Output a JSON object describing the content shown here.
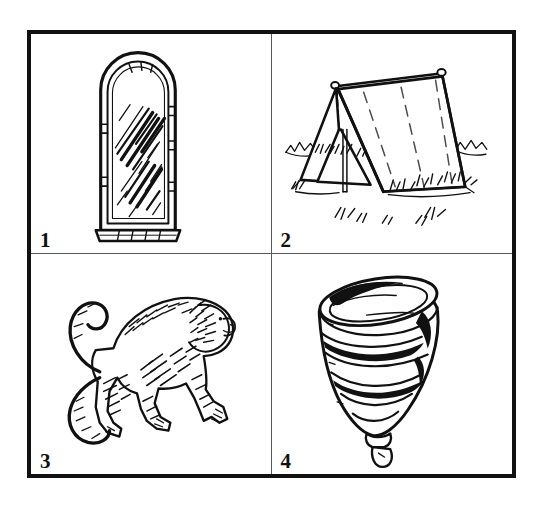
{
  "sheet": {
    "title": "Picture naming card sheet",
    "layout": "2x2 grid of numbered black-and-white line drawings",
    "frame_color": "#111111",
    "divider_color": "#5a5a5a",
    "background_color": "#ffffff",
    "ink_color": "#111111"
  },
  "panels": [
    {
      "number": "1",
      "name": "mirror",
      "label": "mirror",
      "description": "Arched-top standing mirror in a double-outlined frame with diagonal hatch strokes across the glass",
      "position": "top-left"
    },
    {
      "number": "2",
      "name": "tent",
      "label": "tent",
      "description": "A-frame ridge tent with ridge pole, guy lines, open triangular entrance and grass tufts on the ground",
      "position": "top-right"
    },
    {
      "number": "3",
      "name": "monkey",
      "label": "monkey",
      "description": "Monkey walking on all fours facing right with a long curled tail raised behind it",
      "position": "bottom-left"
    },
    {
      "number": "4",
      "name": "spinning-top",
      "label": "spinning top",
      "description": "Spinning top tilted on its point with an elliptical rim and spiral banding",
      "position": "bottom-right"
    }
  ]
}
